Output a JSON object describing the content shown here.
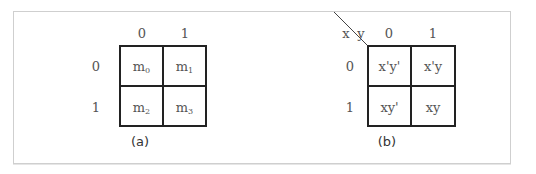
{
  "diagrams": [
    {
      "id": "a",
      "caption": "(a)",
      "col_headers": [
        "0",
        "1"
      ],
      "row_headers": [
        "0",
        "1"
      ],
      "corner_labels": null,
      "cells": [
        [
          {
            "base": "m",
            "sub": "0"
          },
          {
            "base": "m",
            "sub": "1"
          }
        ],
        [
          {
            "base": "m",
            "sub": "2"
          },
          {
            "base": "m",
            "sub": "3"
          }
        ]
      ]
    },
    {
      "id": "b",
      "caption": "(b)",
      "col_headers": [
        "0",
        "1"
      ],
      "row_headers": [
        "0",
        "1"
      ],
      "corner_labels": {
        "row_var": "x",
        "col_var": "y"
      },
      "cells": [
        [
          "x'y'",
          "x'y"
        ],
        [
          "xy'",
          "xy"
        ]
      ]
    }
  ]
}
